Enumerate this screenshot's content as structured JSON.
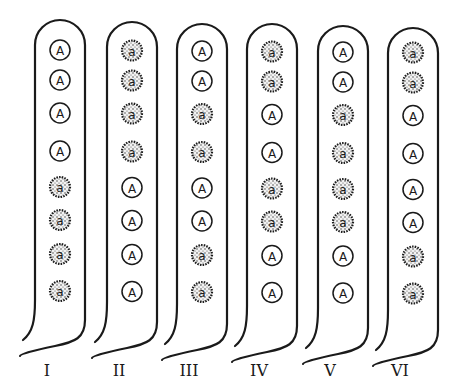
{
  "diagram": {
    "title": "",
    "legend": {
      "dominant": {
        "symbol": "A",
        "style": "open circle"
      },
      "recessive": {
        "symbol": "a",
        "style": "stippled circle"
      }
    },
    "tubes": [
      {
        "label": "I",
        "alleles": [
          "A",
          "A",
          "A",
          "A",
          "a",
          "a",
          "a",
          "a"
        ]
      },
      {
        "label": "II",
        "alleles": [
          "a",
          "a",
          "a",
          "a",
          "A",
          "A",
          "A",
          "A"
        ]
      },
      {
        "label": "III",
        "alleles": [
          "A",
          "A",
          "a",
          "a",
          "A",
          "A",
          "a",
          "a"
        ]
      },
      {
        "label": "IV",
        "alleles": [
          "a",
          "a",
          "A",
          "A",
          "a",
          "a",
          "A",
          "A"
        ]
      },
      {
        "label": "V",
        "alleles": [
          "A",
          "A",
          "a",
          "a",
          "a",
          "a",
          "A",
          "A"
        ]
      },
      {
        "label": "VI",
        "alleles": [
          "a",
          "a",
          "A",
          "A",
          "A",
          "A",
          "a",
          "a"
        ]
      }
    ]
  }
}
